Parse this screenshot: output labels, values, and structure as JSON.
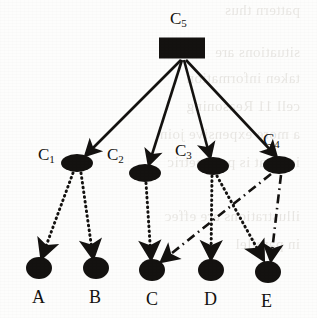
{
  "figure": {
    "type": "directed-graph",
    "caption": "",
    "background_bleed": [
      "pattern thus",
      "situations are",
      "taken information",
      "cell 11 Reasoning",
      "a more expensive join",
      "is what is parametric",
      "illustrations are effec",
      "in parallel"
    ]
  },
  "nodes": {
    "cause_nodes": [
      {
        "id": "C5",
        "label": "C",
        "subscript": "5",
        "shape": "rectangle",
        "x": 182,
        "y": 48,
        "w": 46,
        "h": 21,
        "label_x": 173,
        "label_y": 12
      },
      {
        "id": "C1",
        "label": "C",
        "subscript": "1",
        "shape": "ellipse",
        "x": 77,
        "y": 163,
        "rx": 16,
        "ry": 9,
        "label_x": 41,
        "label_y": 148
      },
      {
        "id": "C2",
        "label": "C",
        "subscript": "2",
        "shape": "ellipse",
        "x": 145,
        "y": 173,
        "rx": 16,
        "ry": 9,
        "label_x": 110,
        "label_y": 148
      },
      {
        "id": "C3",
        "label": "C",
        "subscript": "3",
        "shape": "ellipse",
        "x": 213,
        "y": 166,
        "rx": 16,
        "ry": 9,
        "label_x": 177,
        "label_y": 146
      },
      {
        "id": "C4",
        "label": "C",
        "subscript": "4",
        "shape": "ellipse",
        "x": 279,
        "y": 165,
        "rx": 16,
        "ry": 9,
        "label_x": 265,
        "label_y": 134
      }
    ],
    "effect_nodes": [
      {
        "id": "A",
        "label": "A",
        "shape": "circle",
        "x": 39,
        "y": 268,
        "rx": 13,
        "ry": 11,
        "label_x": 32,
        "label_y": 282
      },
      {
        "id": "B",
        "label": "B",
        "shape": "circle",
        "x": 96,
        "y": 268,
        "rx": 13,
        "ry": 11,
        "label_x": 89,
        "label_y": 282
      },
      {
        "id": "C",
        "label": "C",
        "shape": "circle",
        "x": 152,
        "y": 270,
        "rx": 13,
        "ry": 11,
        "label_x": 145,
        "label_y": 284
      },
      {
        "id": "D",
        "label": "D",
        "shape": "circle",
        "x": 211,
        "y": 270,
        "rx": 13,
        "ry": 11,
        "label_x": 203,
        "label_y": 284
      },
      {
        "id": "E",
        "label": "E",
        "shape": "circle",
        "x": 268,
        "y": 272,
        "rx": 13,
        "ry": 11,
        "label_x": 261,
        "label_y": 286
      }
    ]
  },
  "edges": [
    {
      "from": "C5",
      "to": "C1",
      "style": "solid",
      "x1": 181,
      "y1": 60,
      "x2": 86,
      "y2": 155
    },
    {
      "from": "C5",
      "to": "C2",
      "style": "solid",
      "x1": 182,
      "y1": 60,
      "x2": 149,
      "y2": 164
    },
    {
      "from": "C5",
      "to": "C3",
      "style": "solid",
      "x1": 184,
      "y1": 60,
      "x2": 210,
      "y2": 157
    },
    {
      "from": "C5",
      "to": "C4",
      "style": "solid",
      "x1": 186,
      "y1": 60,
      "x2": 276,
      "y2": 156
    },
    {
      "from": "C1",
      "to": "A",
      "style": "dotted",
      "x1": 73,
      "y1": 173,
      "x2": 42,
      "y2": 257
    },
    {
      "from": "C1",
      "to": "B",
      "style": "dotted",
      "x1": 81,
      "y1": 173,
      "x2": 93,
      "y2": 257
    },
    {
      "from": "C2",
      "to": "C",
      "style": "dotted",
      "x1": 146,
      "y1": 183,
      "x2": 151,
      "y2": 258
    },
    {
      "from": "C3",
      "to": "D",
      "style": "dotted",
      "x1": 212,
      "y1": 176,
      "x2": 211,
      "y2": 258
    },
    {
      "from": "C3",
      "to": "E",
      "style": "dotted",
      "x1": 217,
      "y1": 176,
      "x2": 263,
      "y2": 259
    },
    {
      "from": "C4",
      "to": "C",
      "style": "dashdot",
      "x1": 271,
      "y1": 174,
      "x2": 162,
      "y2": 261
    },
    {
      "from": "C4",
      "to": "E",
      "style": "dashdot",
      "x1": 281,
      "y1": 175,
      "x2": 271,
      "y2": 260
    }
  ],
  "colors": {
    "ink": "#141210",
    "paper": "#fdfdfc",
    "bleed": "#cfcbc4"
  }
}
